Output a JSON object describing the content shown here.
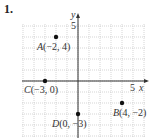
{
  "problem": {
    "number": "1."
  },
  "chart_data": {
    "type": "scatter",
    "title": "",
    "xlabel": "x",
    "ylabel": "y",
    "xlim": [
      -5,
      6
    ],
    "ylim": [
      -5,
      5
    ],
    "grid": true,
    "tick_labels": {
      "x": [
        "5"
      ],
      "y": [
        "5"
      ]
    },
    "points": [
      {
        "name": "A",
        "x": -2,
        "y": 4,
        "label": "A(−2, 4)"
      },
      {
        "name": "B",
        "x": 4,
        "y": -2,
        "label": "B(4, −2)"
      },
      {
        "name": "C",
        "x": -3,
        "y": 0,
        "label": "C(−3, 0)"
      },
      {
        "name": "D",
        "x": 0,
        "y": -3,
        "label": "D(0, −3)"
      }
    ]
  },
  "colors": {
    "grid": "#b8b8b8",
    "axis": "#333333",
    "point": "#111111"
  }
}
